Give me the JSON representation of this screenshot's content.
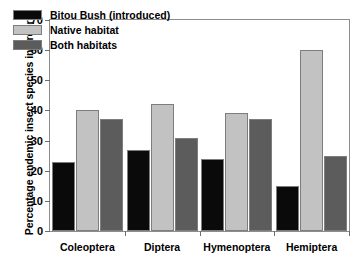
{
  "chart_data": {
    "type": "bar",
    "title": "",
    "xlabel": "",
    "ylabel": "Percentage endemic insect species in orders",
    "ylim": [
      0,
      70
    ],
    "yticks": [
      0,
      10,
      20,
      30,
      40,
      50,
      60,
      70
    ],
    "grid": false,
    "legend_position": "top-left",
    "categories": [
      "Coleoptera",
      "Diptera",
      "Hymenoptera",
      "Hemiptera"
    ],
    "series": [
      {
        "name": "Bitou Bush (introduced)",
        "color": "#0a0a0a",
        "values": [
          23,
          27,
          24,
          15
        ]
      },
      {
        "name": "Native habitat",
        "color": "#c2c2c2",
        "values": [
          40,
          42,
          39,
          60
        ]
      },
      {
        "name": "Both habitats",
        "color": "#5c5c5c",
        "values": [
          37,
          31,
          37,
          25
        ]
      }
    ]
  },
  "axes": {
    "frame_color": "#8d8d8d",
    "tick_color": "#6e6e6e",
    "bar_border_color": "#7d7d7d"
  }
}
